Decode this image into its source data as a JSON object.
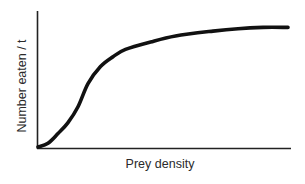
{
  "chart_data": {
    "type": "line",
    "title": "",
    "xlabel": "Prey density",
    "ylabel": "Number eaten / t",
    "grid": false,
    "legend": null,
    "x_ticks": [],
    "y_ticks": [],
    "series": [
      {
        "name": "functional response",
        "x": [
          0,
          0.04,
          0.08,
          0.12,
          0.16,
          0.2,
          0.25,
          0.3,
          0.35,
          0.45,
          0.55,
          0.7,
          0.8,
          0.9,
          1.0
        ],
        "y": [
          0,
          0.03,
          0.11,
          0.2,
          0.33,
          0.52,
          0.66,
          0.74,
          0.8,
          0.86,
          0.91,
          0.95,
          0.97,
          0.98,
          0.98
        ]
      }
    ],
    "xlim": [
      0,
      1
    ],
    "ylim": [
      0,
      1
    ]
  },
  "colors": {
    "curve": "#111111",
    "axes": "#222222",
    "background": "#ffffff"
  }
}
